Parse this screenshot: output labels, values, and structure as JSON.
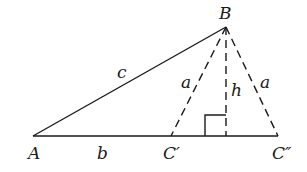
{
  "diagram": {
    "type": "geometry",
    "colors": {
      "stroke": "#1a1a1a",
      "background": "#ffffff"
    },
    "points": {
      "A": {
        "label": "A",
        "x": 33,
        "y": 136
      },
      "B": {
        "label": "B",
        "x": 226,
        "y": 27
      },
      "C1": {
        "label": "C′",
        "x": 171,
        "y": 136
      },
      "C2": {
        "label": "C″",
        "x": 278,
        "y": 136
      },
      "H": {
        "x": 226,
        "y": 136
      }
    },
    "segments": [
      {
        "from": "A",
        "to": "B",
        "style": "solid",
        "label": "c"
      },
      {
        "from": "A",
        "to": "C2",
        "style": "solid",
        "label": "b"
      },
      {
        "from": "B",
        "to": "C1",
        "style": "dashed",
        "label": "a"
      },
      {
        "from": "B",
        "to": "H",
        "style": "dashed",
        "label": "h"
      },
      {
        "from": "B",
        "to": "C2",
        "style": "dashed",
        "label": "a"
      }
    ],
    "labels": {
      "A": "A",
      "B": "B",
      "C1": "C′",
      "C2": "C″",
      "b": "b",
      "c": "c",
      "a_left": "a",
      "a_right": "a",
      "h": "h"
    },
    "right_angle_marker": {
      "at": "H",
      "size": 20
    }
  }
}
